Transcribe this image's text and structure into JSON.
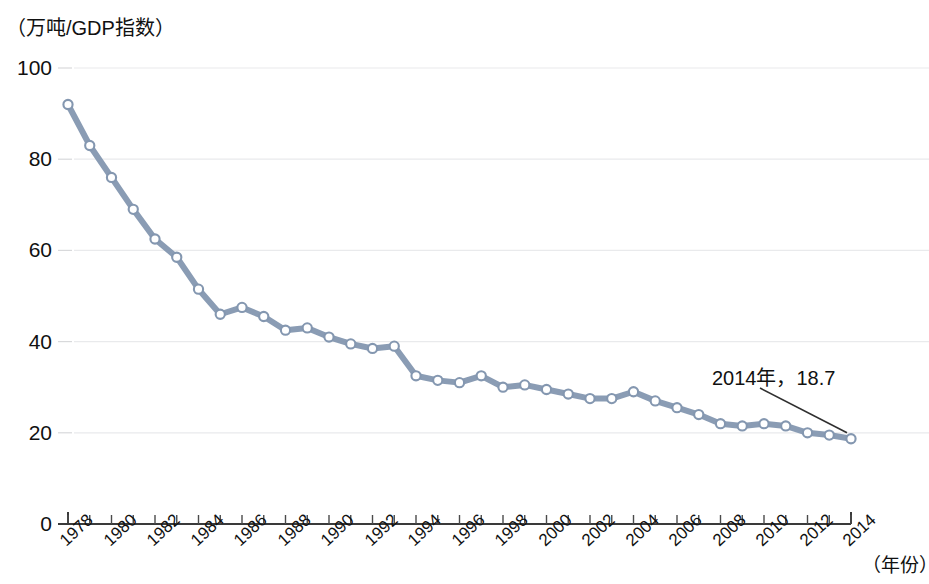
{
  "chart_data": {
    "type": "line",
    "title": "",
    "subtitle": "",
    "ylabel": "（万吨/GDP指数）",
    "xlabel": "（年份）",
    "grid": true,
    "legend": null,
    "xlim": [
      1978,
      2014
    ],
    "ylim": [
      0,
      100
    ],
    "yticks": [
      0,
      20,
      40,
      60,
      80,
      100
    ],
    "ytick_labels": [
      "0",
      "20",
      "40",
      "60",
      "80",
      "100"
    ],
    "xticks": [
      1978,
      1980,
      1982,
      1984,
      1986,
      1988,
      1990,
      1992,
      1994,
      1996,
      1998,
      2000,
      2002,
      2004,
      2006,
      2008,
      2010,
      2012,
      2014
    ],
    "xtick_labels": [
      "1978",
      "1980",
      "1982",
      "1984",
      "1986",
      "1988",
      "1990",
      "1992",
      "1994",
      "1996",
      "1998",
      "2000",
      "2002",
      "2004",
      "2006",
      "2008",
      "2010",
      "2012",
      "2014"
    ],
    "line_color": "#8497b0",
    "marker_face_color": "#ffffff",
    "marker_edge_color": "#8497b0",
    "x": [
      1978,
      1979,
      1980,
      1981,
      1982,
      1983,
      1984,
      1985,
      1986,
      1987,
      1988,
      1989,
      1990,
      1991,
      1992,
      1993,
      1994,
      1995,
      1996,
      1997,
      1998,
      1999,
      2000,
      2001,
      2002,
      2003,
      2004,
      2005,
      2006,
      2007,
      2008,
      2009,
      2010,
      2011,
      2012,
      2013,
      2014
    ],
    "values": [
      92.0,
      83.0,
      76.0,
      69.0,
      62.5,
      58.5,
      51.5,
      46.0,
      47.5,
      45.5,
      42.5,
      43.0,
      41.0,
      39.5,
      38.5,
      39.0,
      32.5,
      31.5,
      31.0,
      32.5,
      30.0,
      30.5,
      29.5,
      28.5,
      27.5,
      27.5,
      29.0,
      27.0,
      25.5,
      24.0,
      22.0,
      21.5,
      22.0,
      21.5,
      20.0,
      19.5,
      18.7
    ],
    "annotations": [
      {
        "text": "2014年，18.7",
        "point_x": 2014,
        "point_y": 18.7
      }
    ]
  }
}
